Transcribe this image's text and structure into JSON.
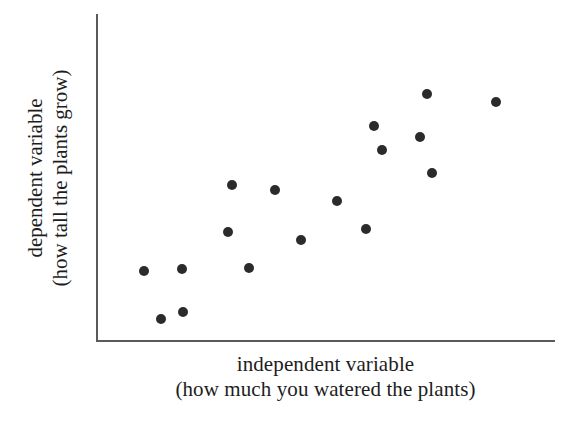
{
  "chart_data": {
    "type": "scatter",
    "title": "",
    "xlabel": "independent variable",
    "xlabel_sub": "(how much you watered the plants)",
    "ylabel": "dependent variable",
    "ylabel_sub": "(how tall the plants grow)",
    "xlim": [
      0,
      100
    ],
    "ylim": [
      0,
      100
    ],
    "grid": false,
    "legend": false,
    "axis_ticks": false,
    "axis_tick_labels": [],
    "point_color": "#2b2b2b",
    "axis_color": "#5a5a5a",
    "background_color": "#ffffff",
    "n_points": 17,
    "correlation": "positive",
    "points": [
      {
        "x": 10.1,
        "y": 21.2
      },
      {
        "x": 18.4,
        "y": 21.8
      },
      {
        "x": 13.8,
        "y": 6.4
      },
      {
        "x": 18.6,
        "y": 8.6
      },
      {
        "x": 29.3,
        "y": 47.5
      },
      {
        "x": 28.4,
        "y": 33.1
      },
      {
        "x": 33.0,
        "y": 22.1
      },
      {
        "x": 38.7,
        "y": 46.0
      },
      {
        "x": 44.4,
        "y": 30.7
      },
      {
        "x": 52.3,
        "y": 42.6
      },
      {
        "x": 58.6,
        "y": 34.0
      },
      {
        "x": 60.4,
        "y": 65.6
      },
      {
        "x": 62.1,
        "y": 58.3
      },
      {
        "x": 70.5,
        "y": 62.3
      },
      {
        "x": 73.1,
        "y": 51.2
      },
      {
        "x": 72.0,
        "y": 75.5
      },
      {
        "x": 87.1,
        "y": 73.0
      }
    ]
  },
  "axis_labels": {
    "x_main": "independent variable",
    "x_sub": "(how much you watered the plants)",
    "y_main": "dependent variable",
    "y_sub": "(how tall the plants grow)"
  }
}
